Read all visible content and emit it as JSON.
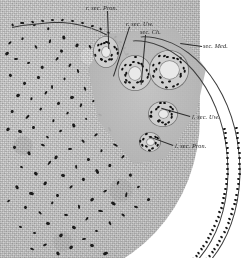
{
  "figure": {
    "kind": "histological-micrograph",
    "medium": "halftone engraving plate",
    "background_color": "#ffffff",
    "tissue_color": "#d2d2d2",
    "nucleus_color": "#1a1a1a",
    "ink_color": "#2b2b2b",
    "label_color": "#232323"
  },
  "labels": [
    {
      "id": "r-sec-pron",
      "text": "r. sec. Pron.",
      "x": 86,
      "y": 4,
      "leader": {
        "x": 108,
        "y": 11,
        "len": 38,
        "angle": 88
      }
    },
    {
      "id": "r-sec-uw",
      "text": "r. sec. Uw.",
      "x": 126,
      "y": 20,
      "leader": {
        "x": 130,
        "y": 27,
        "len": 52,
        "angle": 108
      }
    },
    {
      "id": "sec-ch",
      "text": "sec. Ch.",
      "x": 140,
      "y": 28,
      "leader": {
        "x": 146,
        "y": 35,
        "len": 50,
        "angle": 95
      }
    },
    {
      "id": "sec-med",
      "text": "sec. Med.",
      "x": 203,
      "y": 42,
      "leader": {
        "x": 202,
        "y": 47,
        "len": 22,
        "angle": 188
      }
    },
    {
      "id": "l-sec-uw",
      "text": "l. sec. Uw.",
      "x": 192,
      "y": 113,
      "leader": {
        "x": 190,
        "y": 117,
        "len": 30,
        "angle": 196
      }
    },
    {
      "id": "l-sec-pron",
      "text": "l. sec. Pron.",
      "x": 175,
      "y": 142,
      "leader": {
        "x": 173,
        "y": 146,
        "len": 26,
        "angle": 200
      }
    }
  ],
  "structures": [
    {
      "id": "mesenchyme-mass",
      "name": "mesenchyme / blastema mass",
      "region": "left and lower-left"
    },
    {
      "id": "surface-epithelium",
      "name": "surface epithelium",
      "region": "dorsal top-left edge"
    },
    {
      "id": "coelomic-margin",
      "name": "coelomic epithelial margin",
      "region": "lower-right border"
    },
    {
      "id": "tubule-cluster",
      "name": "sectioned tubules",
      "region": "upper-right apex"
    }
  ],
  "mesenchyme_nuclei": [
    [
      8,
      42
    ],
    [
      21,
      38
    ],
    [
      34,
      46
    ],
    [
      48,
      40
    ],
    [
      60,
      50
    ],
    [
      14,
      58
    ],
    [
      27,
      62
    ],
    [
      41,
      66
    ],
    [
      55,
      58
    ],
    [
      68,
      64
    ],
    [
      9,
      74
    ],
    [
      23,
      82
    ],
    [
      37,
      76
    ],
    [
      50,
      86
    ],
    [
      63,
      78
    ],
    [
      76,
      70
    ],
    [
      16,
      94
    ],
    [
      30,
      98
    ],
    [
      44,
      92
    ],
    [
      57,
      102
    ],
    [
      70,
      96
    ],
    [
      83,
      88
    ],
    [
      11,
      110
    ],
    [
      25,
      116
    ],
    [
      39,
      108
    ],
    [
      52,
      120
    ],
    [
      66,
      112
    ],
    [
      79,
      104
    ],
    [
      92,
      100
    ],
    [
      18,
      130
    ],
    [
      32,
      126
    ],
    [
      46,
      136
    ],
    [
      59,
      130
    ],
    [
      72,
      124
    ],
    [
      85,
      118
    ],
    [
      98,
      114
    ],
    [
      13,
      146
    ],
    [
      27,
      152
    ],
    [
      41,
      144
    ],
    [
      54,
      156
    ],
    [
      68,
      148
    ],
    [
      81,
      140
    ],
    [
      94,
      134
    ],
    [
      107,
      128
    ],
    [
      20,
      166
    ],
    [
      34,
      172
    ],
    [
      47,
      162
    ],
    [
      61,
      174
    ],
    [
      74,
      166
    ],
    [
      87,
      158
    ],
    [
      100,
      150
    ],
    [
      113,
      144
    ],
    [
      15,
      186
    ],
    [
      29,
      192
    ],
    [
      43,
      182
    ],
    [
      56,
      194
    ],
    [
      69,
      186
    ],
    [
      82,
      178
    ],
    [
      95,
      170
    ],
    [
      108,
      164
    ],
    [
      121,
      156
    ],
    [
      24,
      206
    ],
    [
      38,
      212
    ],
    [
      51,
      202
    ],
    [
      64,
      214
    ],
    [
      77,
      206
    ],
    [
      90,
      198
    ],
    [
      103,
      190
    ],
    [
      116,
      182
    ],
    [
      129,
      174
    ],
    [
      19,
      226
    ],
    [
      33,
      232
    ],
    [
      46,
      222
    ],
    [
      59,
      234
    ],
    [
      72,
      226
    ],
    [
      85,
      218
    ],
    [
      98,
      210
    ],
    [
      111,
      202
    ],
    [
      124,
      194
    ],
    [
      137,
      186
    ],
    [
      30,
      248
    ],
    [
      43,
      244
    ],
    [
      56,
      252
    ],
    [
      69,
      246
    ],
    [
      82,
      238
    ],
    [
      95,
      230
    ],
    [
      108,
      222
    ],
    [
      121,
      214
    ],
    [
      134,
      206
    ],
    [
      147,
      198
    ],
    [
      5,
      52
    ],
    [
      6,
      128
    ],
    [
      7,
      200
    ],
    [
      88,
      46
    ],
    [
      100,
      56
    ],
    [
      62,
      36
    ],
    [
      75,
      44
    ],
    [
      47,
      28
    ],
    [
      33,
      24
    ],
    [
      20,
      22
    ],
    [
      90,
      244
    ],
    [
      103,
      252
    ]
  ],
  "surface_epithelium_nuclei": [
    [
      12,
      27
    ],
    [
      22,
      25
    ],
    [
      32,
      24
    ],
    [
      42,
      23
    ],
    [
      52,
      22
    ],
    [
      62,
      22
    ],
    [
      72,
      23
    ],
    [
      82,
      25
    ],
    [
      92,
      28
    ],
    [
      100,
      31
    ],
    [
      108,
      35
    ],
    [
      115,
      39
    ],
    [
      120,
      44
    ],
    [
      124,
      50
    ],
    [
      127,
      56
    ]
  ],
  "tubules": [
    {
      "id": "r-sec-pron-tubule",
      "cx": 106,
      "cy": 52,
      "rx": 13,
      "ry": 16,
      "lumen_rx": 4,
      "lumen_ry": 5,
      "nuclei": 16
    },
    {
      "id": "r-sec-uw-tubule",
      "cx": 135,
      "cy": 73,
      "rx": 17,
      "ry": 18,
      "lumen_rx": 6,
      "lumen_ry": 6.5,
      "nuclei": 20
    },
    {
      "id": "sec-ch-tubule",
      "cx": 169,
      "cy": 70,
      "rx": 20,
      "ry": 20,
      "lumen_rx": 9.5,
      "lumen_ry": 9,
      "nuclei": 22
    },
    {
      "id": "l-sec-uw-tubule",
      "cx": 163,
      "cy": 114,
      "rx": 15,
      "ry": 13,
      "lumen_rx": 4.5,
      "lumen_ry": 4,
      "nuclei": 17
    },
    {
      "id": "l-sec-pron-tubule",
      "cx": 150,
      "cy": 142,
      "rx": 11,
      "ry": 10,
      "lumen_rx": 3.5,
      "lumen_ry": 3,
      "nuclei": 12
    }
  ],
  "margin_bands": [
    {
      "id": "outer-band",
      "left": 60,
      "top": 36,
      "w": 178,
      "h": 250,
      "rot": -6
    },
    {
      "id": "inner-band",
      "left": 56,
      "top": 40,
      "w": 170,
      "h": 242,
      "rot": -6
    }
  ]
}
